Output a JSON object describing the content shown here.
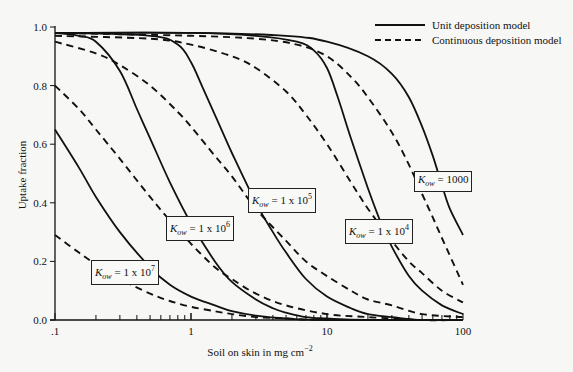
{
  "chart_data": {
    "type": "line",
    "title": "",
    "xlabel": "Soil on skin in mg cm-2",
    "xlabel_parts": {
      "main": "Soil on skin in mg cm",
      "sup": "−2"
    },
    "ylabel": "Uptake fraction",
    "xscale": "log",
    "xlim": [
      0.1,
      100
    ],
    "ylim": [
      0.0,
      1.0
    ],
    "x_tick_labels": [
      ".1",
      "1",
      "10",
      "100"
    ],
    "x_ticks": [
      0.1,
      1,
      10,
      100
    ],
    "y_tick_labels": [
      "0.0",
      "0.2",
      "0.4",
      "0.6",
      "0.8",
      "1.0"
    ],
    "y_ticks": [
      0.0,
      0.2,
      0.4,
      0.6,
      0.8,
      1.0
    ],
    "grid": false,
    "legend_position": "top-right",
    "legend": [
      {
        "label": "Unit deposition model",
        "style": "solid"
      },
      {
        "label": "Continuous deposition model",
        "style": "dashed"
      }
    ],
    "series": [
      {
        "name": "Kow = 1000, Unit deposition",
        "style": "solid",
        "x": [
          0.1,
          1,
          5,
          10,
          20,
          30,
          40,
          50,
          60,
          70,
          80,
          100
        ],
        "y": [
          0.98,
          0.98,
          0.97,
          0.95,
          0.9,
          0.84,
          0.76,
          0.66,
          0.56,
          0.46,
          0.38,
          0.29
        ]
      },
      {
        "name": "Kow = 1000, Continuous deposition",
        "style": "dashed",
        "x": [
          0.1,
          1,
          3,
          6,
          10,
          15,
          20,
          30,
          40,
          50,
          60,
          70,
          100
        ],
        "y": [
          0.98,
          0.97,
          0.96,
          0.94,
          0.9,
          0.83,
          0.76,
          0.64,
          0.53,
          0.43,
          0.35,
          0.28,
          0.12
        ]
      },
      {
        "name": "Kow = 1 x 10^4, Unit deposition",
        "style": "solid",
        "x": [
          0.1,
          1,
          3,
          6,
          8,
          10,
          12,
          15,
          20,
          25,
          30,
          40,
          50,
          70,
          100
        ],
        "y": [
          0.98,
          0.98,
          0.97,
          0.95,
          0.92,
          0.86,
          0.76,
          0.62,
          0.45,
          0.33,
          0.25,
          0.15,
          0.1,
          0.05,
          0.02
        ]
      },
      {
        "name": "Kow = 1 x 10^4, Continuous deposition",
        "style": "dashed",
        "x": [
          0.1,
          0.5,
          1,
          2,
          3,
          5,
          7,
          10,
          15,
          20,
          30,
          40,
          50,
          70,
          100
        ],
        "y": [
          0.97,
          0.96,
          0.94,
          0.9,
          0.86,
          0.78,
          0.7,
          0.6,
          0.47,
          0.38,
          0.27,
          0.2,
          0.16,
          0.1,
          0.06
        ]
      },
      {
        "name": "Kow = 1 x 10^5, Unit deposition",
        "style": "solid",
        "x": [
          0.1,
          0.5,
          0.8,
          1,
          1.2,
          1.5,
          2,
          3,
          4,
          5,
          7,
          10,
          15,
          20,
          30,
          50,
          100
        ],
        "y": [
          0.98,
          0.97,
          0.94,
          0.88,
          0.8,
          0.7,
          0.57,
          0.4,
          0.3,
          0.23,
          0.14,
          0.08,
          0.04,
          0.02,
          0.01,
          0.0,
          0.0
        ]
      },
      {
        "name": "Kow = 1 x 10^5, Continuous deposition",
        "style": "dashed",
        "x": [
          0.1,
          0.2,
          0.3,
          0.5,
          0.8,
          1,
          1.5,
          2,
          3,
          5,
          7,
          10,
          15,
          20,
          30,
          50,
          100
        ],
        "y": [
          0.95,
          0.91,
          0.87,
          0.8,
          0.71,
          0.66,
          0.56,
          0.49,
          0.38,
          0.27,
          0.2,
          0.15,
          0.1,
          0.07,
          0.05,
          0.02,
          0.01
        ]
      },
      {
        "name": "Kow = 1 x 10^6, Unit deposition",
        "style": "solid",
        "x": [
          0.1,
          0.15,
          0.2,
          0.3,
          0.4,
          0.5,
          0.7,
          1,
          1.5,
          2,
          3,
          4,
          5,
          7,
          10,
          20,
          100
        ],
        "y": [
          0.98,
          0.97,
          0.95,
          0.85,
          0.72,
          0.62,
          0.47,
          0.33,
          0.2,
          0.13,
          0.07,
          0.04,
          0.025,
          0.01,
          0.005,
          0.0,
          0.0
        ]
      },
      {
        "name": "Kow = 1 x 10^6, Continuous deposition",
        "style": "dashed",
        "x": [
          0.1,
          0.15,
          0.2,
          0.3,
          0.5,
          0.7,
          1,
          1.5,
          2,
          3,
          5,
          10,
          20,
          50,
          100
        ],
        "y": [
          0.8,
          0.72,
          0.65,
          0.55,
          0.42,
          0.34,
          0.26,
          0.18,
          0.14,
          0.09,
          0.05,
          0.02,
          0.01,
          0.0,
          0.0
        ]
      },
      {
        "name": "Kow = 1 x 10^7, Unit deposition",
        "style": "solid",
        "x": [
          0.1,
          0.15,
          0.2,
          0.3,
          0.5,
          0.7,
          1,
          1.5,
          2,
          3,
          5,
          10,
          100
        ],
        "y": [
          0.65,
          0.52,
          0.42,
          0.3,
          0.18,
          0.12,
          0.08,
          0.05,
          0.03,
          0.015,
          0.005,
          0.0,
          0.0
        ]
      },
      {
        "name": "Kow = 1 x 10^7, Continuous deposition",
        "style": "dashed",
        "x": [
          0.1,
          0.15,
          0.2,
          0.3,
          0.5,
          0.7,
          1,
          1.5,
          2,
          3,
          5,
          10,
          100
        ],
        "y": [
          0.29,
          0.23,
          0.19,
          0.14,
          0.09,
          0.065,
          0.045,
          0.03,
          0.02,
          0.01,
          0.005,
          0.0,
          0.0
        ]
      }
    ],
    "annotations": [
      {
        "text": "Kow = 1000",
        "k": "K",
        "sub": "ow",
        "rest": " = 1000",
        "sup": "",
        "x_px": 414,
        "y_px": 171
      },
      {
        "text": "Kow = 1 x 10^4",
        "k": "K",
        "sub": "ow",
        "rest": " = 1 x 10",
        "sup": "4",
        "x_px": 345,
        "y_px": 219
      },
      {
        "text": "Kow = 1 x 10^5",
        "k": "K",
        "sub": "ow",
        "rest": " = 1 x 10",
        "sup": "5",
        "x_px": 248,
        "y_px": 188
      },
      {
        "text": "Kow = 1 x 10^6",
        "k": "K",
        "sub": "ow",
        "rest": " = 1 x 10",
        "sup": "6",
        "x_px": 166,
        "y_px": 216
      },
      {
        "text": "Kow = 1 x 10^7",
        "k": "K",
        "sub": "ow",
        "rest": " = 1 x 10",
        "sup": "7",
        "x_px": 91,
        "y_px": 260
      }
    ]
  },
  "colors": {
    "background": "#f7f7f5",
    "ink": "#111111"
  }
}
